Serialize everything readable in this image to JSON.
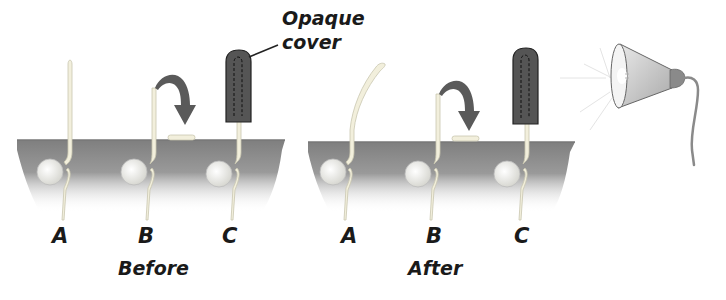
{
  "annotations": {
    "cover_label_line1": "Opaque",
    "cover_label_line2": "cover"
  },
  "panels": [
    {
      "caption": "Before",
      "seedlings": [
        {
          "label": "A",
          "treatment": "untreated",
          "shape": "straight"
        },
        {
          "label": "B",
          "treatment": "tip removed",
          "shape": "straight",
          "arrow": "tip-removed-arrow"
        },
        {
          "label": "C",
          "treatment": "tip covered with opaque cover",
          "shape": "straight"
        }
      ]
    },
    {
      "caption": "After",
      "seedlings": [
        {
          "label": "A",
          "treatment": "untreated",
          "shape": "bent toward light"
        },
        {
          "label": "B",
          "treatment": "tip removed",
          "shape": "straight",
          "arrow": "tip-removed-arrow"
        },
        {
          "label": "C",
          "treatment": "tip covered with opaque cover",
          "shape": "straight"
        }
      ]
    }
  ],
  "light_source": {
    "icon": "lamp-icon",
    "position": "right"
  },
  "colors": {
    "soil": "#8a8a8a",
    "soil_fade": "#ffffff",
    "stem": "#f2efdc",
    "stem_outline": "#c9c6b0",
    "seed": "#eeeeea",
    "cover": "#555555",
    "arrow": "#5a5a5a",
    "lamp": "#cfcfcf",
    "text": "#1a1a1a"
  }
}
